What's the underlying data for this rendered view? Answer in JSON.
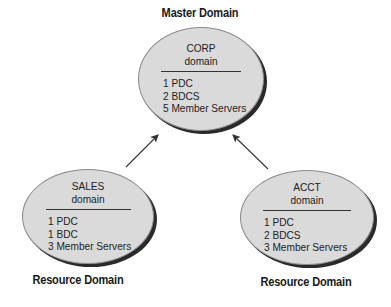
{
  "diagram": {
    "type": "domain-trust-hierarchy",
    "nodes": [
      {
        "id": "corp",
        "role_label": "Master Domain",
        "name": "CORP",
        "subtitle": "domain",
        "items": [
          "1 PDC",
          "2 BDCS",
          "5 Member Servers"
        ]
      },
      {
        "id": "sales",
        "role_label": "Resource Domain",
        "name": "SALES",
        "subtitle": "domain",
        "items": [
          "1 PDC",
          "1 BDC",
          "3 Member Servers"
        ]
      },
      {
        "id": "acct",
        "role_label": "Resource Domain",
        "name": "ACCT",
        "subtitle": "domain",
        "items": [
          "1 PDC",
          "2 BDCS",
          "3 Member Servers"
        ]
      }
    ],
    "edges": [
      {
        "from": "sales",
        "to": "corp"
      },
      {
        "from": "acct",
        "to": "corp"
      }
    ],
    "colors": {
      "node_fill": "#dadada",
      "node_shadow": "#2a2a2a",
      "text": "#1a1a1a",
      "background": "#ffffff"
    }
  }
}
